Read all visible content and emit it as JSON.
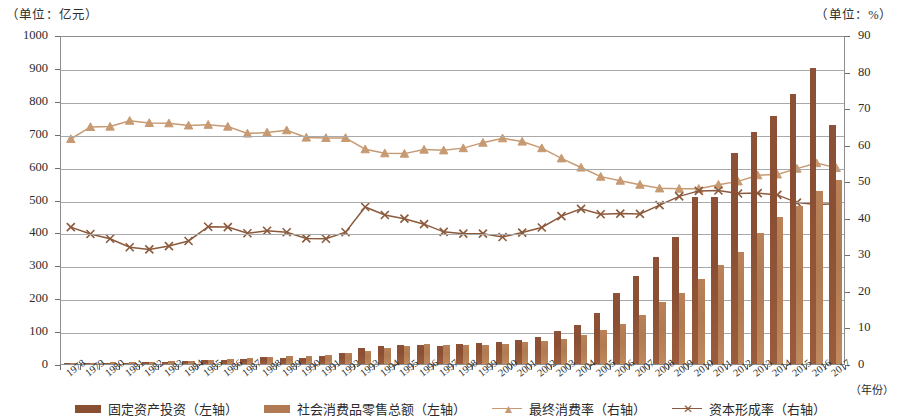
{
  "axis_units": {
    "left": "（单位：亿元）",
    "right": "（单位：%）"
  },
  "xaxis_title": "（年份）",
  "legend": [
    {
      "label": "固定资产投资（左轴）",
      "type": "bar",
      "color": "#8a4f33",
      "name": "legend-fixed-asset-investment"
    },
    {
      "label": "社会消费品零售总额（左轴）",
      "type": "bar",
      "color": "#b07a52",
      "name": "legend-retail-sales"
    },
    {
      "label": "最终消费率（右轴）",
      "type": "line-triangle",
      "color": "#c79a72",
      "name": "legend-final-consumption-rate"
    },
    {
      "label": "资本形成率（右轴）",
      "type": "line-x",
      "color": "#8b5a3c",
      "name": "legend-capital-formation-rate"
    }
  ],
  "chart_data": {
    "type": "bar",
    "title": "",
    "xlabel": "（年份）",
    "ylabel": "（单位：亿元）",
    "y2label": "（单位：%）",
    "ylim": [
      0,
      1000
    ],
    "y2lim": [
      0,
      90
    ],
    "ytick_step": 100,
    "y2tick_step": 10,
    "grid": true,
    "legend_position": "bottom",
    "yticks": [
      0,
      100,
      200,
      300,
      400,
      500,
      600,
      700,
      800,
      900,
      1000
    ],
    "y2ticks": [
      0,
      10,
      20,
      30,
      40,
      50,
      60,
      70,
      80,
      90
    ],
    "categories": [
      "1978",
      "1979",
      "1980",
      "1981",
      "1982",
      "1983",
      "1984",
      "1985",
      "1986",
      "1987",
      "1988",
      "1989",
      "1990",
      "1991",
      "1992",
      "1993",
      "1994",
      "1995",
      "1996",
      "1997",
      "1998",
      "1999",
      "2000",
      "2001",
      "2002",
      "2003",
      "2004",
      "2005",
      "2006",
      "2007",
      "2008",
      "2009",
      "2010",
      "2011",
      "2012",
      "2013",
      "2014",
      "2015",
      "2016",
      "2017"
    ],
    "series": [
      {
        "name": "固定资产投资（左轴）",
        "axis": "left",
        "type": "bar",
        "color": "#8a4f33",
        "values": [
          2,
          3,
          4,
          4,
          5,
          6,
          8,
          11,
          13,
          16,
          20,
          18,
          19,
          24,
          34,
          50,
          55,
          57,
          58,
          56,
          62,
          64,
          68,
          74,
          82,
          99,
          120,
          155,
          215,
          268,
          325,
          385,
          508,
          508,
          640,
          705,
          755,
          820,
          900,
          725
        ]
      },
      {
        "name": "社会消费品零售总额（左轴）",
        "axis": "left",
        "type": "bar",
        "color": "#b07a52",
        "values": [
          3,
          4,
          5,
          6,
          7,
          8,
          10,
          13,
          15,
          18,
          22,
          24,
          25,
          28,
          33,
          40,
          50,
          56,
          60,
          58,
          57,
          58,
          62,
          66,
          70,
          76,
          88,
          104,
          122,
          148,
          188,
          215,
          258,
          300,
          340,
          398,
          448,
          480,
          525,
          560
        ]
      },
      {
        "name": "最终消费率（右轴）",
        "axis": "right",
        "type": "line",
        "marker": "triangle",
        "color": "#c79a72",
        "values": [
          62.1,
          65.4,
          65.5,
          67.1,
          66.5,
          66.4,
          65.8,
          66.0,
          65.5,
          63.6,
          63.9,
          64.5,
          62.5,
          62.4,
          62.4,
          59.3,
          58.2,
          58.1,
          59.2,
          59.0,
          59.6,
          61.1,
          62.3,
          61.4,
          59.6,
          56.8,
          54.3,
          51.8,
          50.7,
          49.6,
          48.6,
          48.5,
          48.5,
          49.6,
          50.5,
          52.2,
          52.4,
          54.0,
          55.5,
          54.2
        ]
      },
      {
        "name": "资本形成率（右轴）",
        "axis": "right",
        "type": "line",
        "marker": "x",
        "color": "#8b5a3c",
        "values": [
          38.0,
          36.1,
          34.8,
          32.5,
          31.9,
          32.8,
          34.2,
          38.1,
          38.0,
          36.3,
          37.0,
          36.6,
          34.9,
          34.8,
          36.6,
          43.5,
          41.3,
          40.3,
          38.8,
          36.7,
          36.2,
          36.2,
          35.3,
          36.5,
          37.9,
          41.0,
          43.0,
          41.5,
          41.7,
          41.6,
          44.0,
          46.4,
          47.9,
          48.0,
          47.2,
          47.3,
          46.8,
          44.7,
          44.2,
          44.4
        ]
      }
    ]
  }
}
